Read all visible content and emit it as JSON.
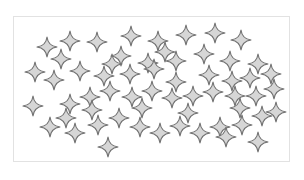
{
  "figure": {
    "frame": {
      "x": 13,
      "y": 16,
      "width": 277,
      "height": 146,
      "border_color": "#e2e2e2"
    },
    "star_style": {
      "fill": "#d6d6d6",
      "stroke": "#707070",
      "stroke_width": 1.1,
      "radius": 10,
      "inner": 3.2
    },
    "star_count": 60,
    "stars": [
      [
        47,
        47
      ],
      [
        70,
        41
      ],
      [
        97,
        42
      ],
      [
        131,
        36
      ],
      [
        158,
        41
      ],
      [
        186,
        35
      ],
      [
        215,
        33
      ],
      [
        241,
        40
      ],
      [
        61,
        59
      ],
      [
        121,
        56
      ],
      [
        148,
        63
      ],
      [
        176,
        61
      ],
      [
        204,
        54
      ],
      [
        230,
        61
      ],
      [
        258,
        64
      ],
      [
        35,
        72
      ],
      [
        54,
        80
      ],
      [
        80,
        71
      ],
      [
        104,
        76
      ],
      [
        130,
        74
      ],
      [
        154,
        69
      ],
      [
        176,
        82
      ],
      [
        209,
        75
      ],
      [
        232,
        81
      ],
      [
        250,
        78
      ],
      [
        271,
        74
      ],
      [
        33,
        106
      ],
      [
        70,
        104
      ],
      [
        90,
        97
      ],
      [
        110,
        91
      ],
      [
        132,
        97
      ],
      [
        152,
        91
      ],
      [
        172,
        98
      ],
      [
        193,
        96
      ],
      [
        213,
        92
      ],
      [
        235,
        96
      ],
      [
        256,
        96
      ],
      [
        274,
        89
      ],
      [
        50,
        127
      ],
      [
        75,
        133
      ],
      [
        98,
        125
      ],
      [
        119,
        118
      ],
      [
        140,
        127
      ],
      [
        160,
        133
      ],
      [
        180,
        126
      ],
      [
        200,
        133
      ],
      [
        220,
        127
      ],
      [
        242,
        125
      ],
      [
        262,
        116
      ],
      [
        276,
        112
      ],
      [
        108,
        147
      ],
      [
        226,
        137
      ],
      [
        258,
        142
      ],
      [
        66,
        118
      ],
      [
        92,
        110
      ],
      [
        142,
        108
      ],
      [
        188,
        113
      ],
      [
        240,
        108
      ],
      [
        165,
        52
      ],
      [
        112,
        64
      ]
    ]
  }
}
